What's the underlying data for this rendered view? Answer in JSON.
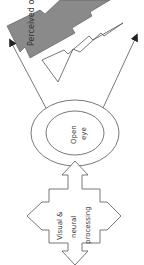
{
  "diagram": {
    "perceived_object_label": "Perceived ob",
    "eye_label_line1": "Open",
    "eye_label_line2": "eye",
    "processing_label_line1": "Visual &",
    "processing_label_line2": "neural",
    "processing_label_line3": "processing"
  },
  "colors": {
    "perceived_object_fill": "#8a8a8a",
    "stroke": "#555555",
    "background": "#ffffff"
  }
}
